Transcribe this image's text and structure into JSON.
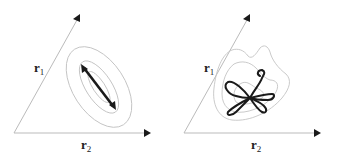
{
  "colors": {
    "axis": "#bbbbbb",
    "contour": "#c4c4c4",
    "trajectory": "#1a1a1a",
    "arrowhead": "#1a1a1a",
    "text": "#222222"
  },
  "panels": [
    {
      "id": "left",
      "description": "Gaussian contours with a principal-direction double-headed arrow",
      "axes": {
        "vertical_label": "r",
        "vertical_sub": "1",
        "horizontal_label": "r",
        "horizontal_sub": "2"
      }
    },
    {
      "id": "right",
      "description": "Non-Gaussian (heart-shaped) contours with a looping flower-like trajectory",
      "axes": {
        "vertical_label": "r",
        "vertical_sub": "1",
        "horizontal_label": "r",
        "horizontal_sub": "2"
      }
    }
  ]
}
